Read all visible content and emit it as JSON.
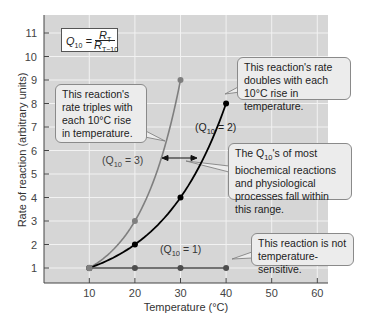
{
  "chart_data": {
    "type": "line",
    "title": "",
    "xlabel": "Temperature (°C)",
    "ylabel": "Rate of reaction (arbitrary units)",
    "x_ticks": [
      10,
      20,
      30,
      40,
      50,
      60
    ],
    "y_ticks": [
      1,
      2,
      3,
      4,
      5,
      6,
      7,
      8,
      9,
      10,
      11
    ],
    "xlim": [
      0,
      62
    ],
    "ylim": [
      0,
      11.8
    ],
    "grid": true,
    "series": [
      {
        "name": "(Q10 = 3)",
        "color": "#7f7f7f",
        "x": [
          10,
          20,
          30
        ],
        "y": [
          1,
          3,
          9
        ]
      },
      {
        "name": "(Q10 = 2)",
        "color": "#000000",
        "x": [
          10,
          20,
          30,
          40
        ],
        "y": [
          1,
          2,
          4,
          8
        ]
      },
      {
        "name": "(Q10 = 1)",
        "color": "#4d4d4d",
        "x": [
          10,
          20,
          30,
          40
        ],
        "y": [
          1,
          1,
          1,
          1
        ]
      }
    ],
    "formula": {
      "lhs": "Q",
      "lhs_sub": "10",
      "num": "R",
      "num_sub": "T",
      "den": "R",
      "den_sub": "T−10"
    },
    "annotations": [
      {
        "id": "q3",
        "text": "This reaction's rate triples with each 10°C rise in temperature."
      },
      {
        "id": "q2",
        "text": "This reaction's rate doubles with each 10°C rise in temperature."
      },
      {
        "id": "range",
        "text_pre": "The Q",
        "text_sub": "10",
        "text_post": "'s of most biochemical reactions and physiological processes fall within this range."
      },
      {
        "id": "q1",
        "text": "This reaction is not temperature-sensitive."
      }
    ],
    "series_labels": {
      "q3_pre": "(Q",
      "q3_post": " = 3)",
      "q2_pre": "(Q",
      "q2_post": " = 2)",
      "q1_pre": "(Q",
      "q1_post": " = 1)",
      "sub": "10"
    }
  },
  "colors": {
    "plot_bg": "#d6d6d6",
    "grid": "#f2f2f2"
  }
}
